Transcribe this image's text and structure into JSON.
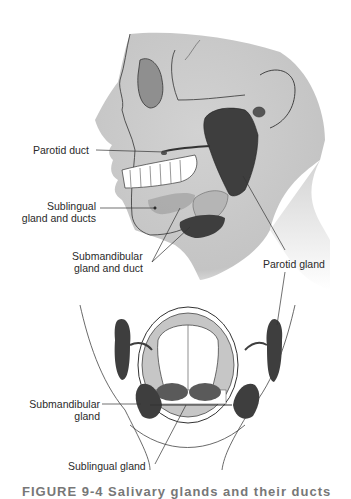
{
  "diagram": {
    "title": "Salivary glands",
    "labels": {
      "parotid_duct": "Parotid duct",
      "sublingual_ducts_line1": "Sublingual",
      "sublingual_ducts_line2": "gland and ducts",
      "submandibular_duct_line1": "Submandibular",
      "submandibular_duct_line2": "gland and duct",
      "parotid_gland": "Parotid gland",
      "submandibular_gland_line1": "Submandibular",
      "submandibular_gland_line2": "gland",
      "sublingual_gland": "Sublingual gland"
    },
    "caption": "FIGURE 9-4  Salivary glands and their ducts"
  },
  "colors": {
    "skin": "#c9c9c9",
    "gland": "#3e3e3e",
    "line": "#333333",
    "sublingual": "#9a9a9a"
  }
}
